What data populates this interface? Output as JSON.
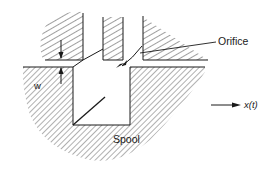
{
  "figure": {
    "type": "engineering-schematic",
    "colors": {
      "ink": "#1a1a1a",
      "hatch": "#2a2a2a",
      "background": "#ffffff"
    }
  },
  "labels": {
    "orifice": "Orifice",
    "spool": "Spool",
    "opening_width": "w",
    "displacement": "x(t)"
  },
  "annotations": {
    "opening_width_arrows": "double arrow indicating orifice opening width w",
    "displacement_arrow": "arrow pointing right indicating spool displacement x(t)",
    "flow_arrow": "curved arrow through orifice indicating flow direction"
  }
}
